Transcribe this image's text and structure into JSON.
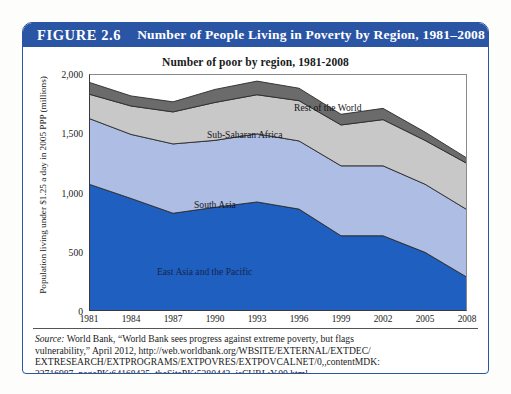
{
  "figure": {
    "number": "FIGURE 2.6",
    "title": "Number of People Living in Poverty by Region, 1981–2008",
    "header_color": "#2a55a5"
  },
  "chart_title": "Number of poor by region, 1981-2008",
  "axes": {
    "ylabel": "Population living under $1.25 a day in 2005 PPP (millions)",
    "yticks": [
      "0",
      "500",
      "1,000",
      "1,500",
      "2,000"
    ],
    "xticks": [
      "1981",
      "1984",
      "1987",
      "1990",
      "1993",
      "1996",
      "1999",
      "2002",
      "2005",
      "2008"
    ]
  },
  "band_labels": [
    {
      "name": "Rest of the World",
      "x": 205,
      "y": 28
    },
    {
      "name": "Sub-Saharan Africa",
      "x": 118,
      "y": 55
    },
    {
      "name": "South Asia",
      "x": 105,
      "y": 125
    },
    {
      "name": "East Asia and the Pacific",
      "x": 68,
      "y": 192
    }
  ],
  "source": {
    "label": "Source:",
    "line1": " World Bank, “World Bank sees progress against extreme poverty, but flags",
    "line2": "vulnerability,” April 2012, http://web.worldbank.org/WBSITE/EXTERNAL/EXTDEC/",
    "line3": "EXTRESEARCH/EXTPROGRAMS/EXTPOVRES/EXTPOVCALNET/0,,contentMDK:",
    "line4": "22716987~pagePK:64168435~theSitePK:5280443~isCURL:Y,00.html."
  },
  "chart_data": {
    "type": "area",
    "stacked": true,
    "title": "Number of poor by region, 1981-2008",
    "xlabel": "",
    "ylabel": "Population living under $1.25 a day in 2005 PPP (millions)",
    "x": [
      1981,
      1984,
      1987,
      1990,
      1993,
      1996,
      1999,
      2002,
      2005,
      2008
    ],
    "ylim": [
      0,
      2000
    ],
    "xlim": [
      1981,
      2008
    ],
    "grid": false,
    "legend_position": "inline-labels",
    "series": [
      {
        "name": "East Asia and the Pacific",
        "color": "#1f5fc0",
        "values": [
          1070,
          950,
          825,
          875,
          920,
          860,
          635,
          635,
          495,
          285
        ]
      },
      {
        "name": "South Asia",
        "color": "#aebde4",
        "values": [
          555,
          540,
          585,
          565,
          575,
          575,
          590,
          590,
          575,
          570
        ]
      },
      {
        "name": "Sub-Saharan Africa",
        "color": "#c8c8c8",
        "values": [
          205,
          240,
          270,
          320,
          330,
          340,
          345,
          390,
          370,
          390
        ]
      },
      {
        "name": "Rest of the World",
        "color": "#6b6b6b",
        "values": [
          100,
          85,
          85,
          110,
          115,
          105,
          90,
          95,
          70,
          45
        ]
      }
    ],
    "totals": [
      1930,
      1815,
      1765,
      1870,
      1940,
      1880,
      1660,
      1710,
      1510,
      1290
    ]
  }
}
